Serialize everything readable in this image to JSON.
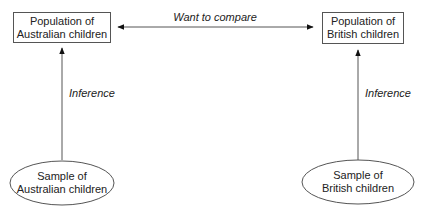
{
  "diagram": {
    "nodes": {
      "pop_aus": {
        "line1": "Population of",
        "line2": "Australian children",
        "shape": "rectangle"
      },
      "pop_brit": {
        "line1": "Population of",
        "line2": "British children",
        "shape": "rectangle"
      },
      "sample_aus": {
        "line1": "Sample of",
        "line2": "Australian children",
        "shape": "ellipse"
      },
      "sample_brit": {
        "line1": "Sample of",
        "line2": "British children",
        "shape": "ellipse"
      }
    },
    "edges": {
      "compare": {
        "label": "Want to compare",
        "from": "pop_aus",
        "to": "pop_brit",
        "direction": "both"
      },
      "inference_aus": {
        "label": "Inference",
        "from": "sample_aus",
        "to": "pop_aus"
      },
      "inference_brit": {
        "label": "Inference",
        "from": "sample_brit",
        "to": "pop_brit"
      }
    },
    "colors": {
      "line": "#555555",
      "text": "#222222",
      "background": "#ffffff"
    }
  }
}
